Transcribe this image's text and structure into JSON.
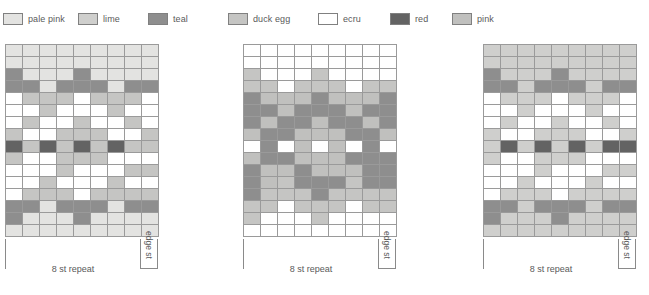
{
  "legend": {
    "items": [
      {
        "label": "pale pink",
        "color": "#e3e3e1"
      },
      {
        "label": "lime",
        "color": "#cfcfcd"
      },
      {
        "label": "teal",
        "color": "#8e8e8e"
      },
      {
        "label": "duck egg",
        "color": "#c5c5c3"
      },
      {
        "label": "ecru",
        "color": "#ffffff"
      },
      {
        "label": "red",
        "color": "#636363"
      },
      {
        "label": "pink",
        "color": "#c0c0be"
      }
    ]
  },
  "charts": [
    {
      "name": "chart-1",
      "columns": 9,
      "rows": 16,
      "repeat_label": "8 st repeat",
      "edge_label": "edge st",
      "edge_columns": 1,
      "grid": [
        [
          "pale pink",
          "pale pink",
          "pale pink",
          "pale pink",
          "pale pink",
          "pale pink",
          "pale pink",
          "pale pink",
          "pale pink"
        ],
        [
          "pale pink",
          "pale pink",
          "pale pink",
          "pale pink",
          "pale pink",
          "pale pink",
          "pale pink",
          "pale pink",
          "pale pink"
        ],
        [
          "teal",
          "pale pink",
          "pale pink",
          "pale pink",
          "teal",
          "pale pink",
          "pale pink",
          "pale pink",
          "pale pink"
        ],
        [
          "teal",
          "teal",
          "pale pink",
          "teal",
          "teal",
          "teal",
          "pale pink",
          "teal",
          "teal"
        ],
        [
          "ecru",
          "duck egg",
          "duck egg",
          "duck egg",
          "ecru",
          "duck egg",
          "duck egg",
          "duck egg",
          "ecru"
        ],
        [
          "ecru",
          "ecru",
          "duck egg",
          "ecru",
          "ecru",
          "ecru",
          "duck egg",
          "ecru",
          "ecru"
        ],
        [
          "ecru",
          "duck egg",
          "ecru",
          "ecru",
          "duck egg",
          "ecru",
          "ecru",
          "duck egg",
          "ecru"
        ],
        [
          "duck egg",
          "ecru",
          "ecru",
          "duck egg",
          "duck egg",
          "duck egg",
          "ecru",
          "ecru",
          "duck egg"
        ],
        [
          "red",
          "duck egg",
          "red",
          "duck egg",
          "red",
          "duck egg",
          "red",
          "duck egg",
          "duck egg"
        ],
        [
          "duck egg",
          "ecru",
          "ecru",
          "duck egg",
          "duck egg",
          "duck egg",
          "ecru",
          "ecru",
          "ecru"
        ],
        [
          "ecru",
          "ecru",
          "ecru",
          "duck egg",
          "ecru",
          "ecru",
          "ecru",
          "duck egg",
          "duck egg"
        ],
        [
          "ecru",
          "ecru",
          "duck egg",
          "ecru",
          "ecru",
          "ecru",
          "duck egg",
          "ecru",
          "ecru"
        ],
        [
          "ecru",
          "duck egg",
          "duck egg",
          "duck egg",
          "ecru",
          "duck egg",
          "duck egg",
          "duck egg",
          "duck egg"
        ],
        [
          "teal",
          "teal",
          "pale pink",
          "teal",
          "teal",
          "teal",
          "pale pink",
          "teal",
          "teal"
        ],
        [
          "teal",
          "pale pink",
          "pale pink",
          "pale pink",
          "teal",
          "pale pink",
          "pale pink",
          "pale pink",
          "pale pink"
        ],
        [
          "pale pink",
          "pale pink",
          "pale pink",
          "pale pink",
          "pale pink",
          "pale pink",
          "pale pink",
          "pale pink",
          "pale pink"
        ]
      ]
    },
    {
      "name": "chart-2",
      "columns": 9,
      "rows": 16,
      "repeat_label": "8 st repeat",
      "edge_label": "edge st",
      "edge_columns": 1,
      "grid": [
        [
          "ecru",
          "ecru",
          "ecru",
          "ecru",
          "ecru",
          "ecru",
          "ecru",
          "ecru",
          "ecru"
        ],
        [
          "ecru",
          "ecru",
          "ecru",
          "ecru",
          "ecru",
          "ecru",
          "ecru",
          "ecru",
          "ecru"
        ],
        [
          "duck egg",
          "ecru",
          "ecru",
          "ecru",
          "duck egg",
          "ecru",
          "ecru",
          "ecru",
          "ecru"
        ],
        [
          "duck egg",
          "duck egg",
          "ecru",
          "duck egg",
          "duck egg",
          "duck egg",
          "ecru",
          "duck egg",
          "duck egg"
        ],
        [
          "teal",
          "pink",
          "pink",
          "pink",
          "teal",
          "pink",
          "pink",
          "pink",
          "teal"
        ],
        [
          "teal",
          "teal",
          "pink",
          "teal",
          "teal",
          "teal",
          "pink",
          "teal",
          "teal"
        ],
        [
          "teal",
          "pink",
          "teal",
          "teal",
          "pink",
          "teal",
          "teal",
          "pink",
          "teal"
        ],
        [
          "pink",
          "teal",
          "teal",
          "pink",
          "pink",
          "pink",
          "teal",
          "teal",
          "pink"
        ],
        [
          "ecru",
          "teal",
          "ecru",
          "pink",
          "ecru",
          "pink",
          "ecru",
          "teal",
          "ecru"
        ],
        [
          "pink",
          "teal",
          "teal",
          "pink",
          "pink",
          "pink",
          "teal",
          "teal",
          "teal"
        ],
        [
          "teal",
          "pink",
          "pink",
          "teal",
          "pink",
          "pink",
          "pink",
          "teal",
          "teal"
        ],
        [
          "teal",
          "pink",
          "duck egg",
          "teal",
          "teal",
          "teal",
          "duck egg",
          "teal",
          "teal"
        ],
        [
          "teal",
          "duck egg",
          "duck egg",
          "duck egg",
          "teal",
          "duck egg",
          "duck egg",
          "duck egg",
          "duck egg"
        ],
        [
          "duck egg",
          "duck egg",
          "ecru",
          "duck egg",
          "duck egg",
          "duck egg",
          "ecru",
          "duck egg",
          "duck egg"
        ],
        [
          "duck egg",
          "ecru",
          "ecru",
          "ecru",
          "duck egg",
          "ecru",
          "ecru",
          "ecru",
          "ecru"
        ],
        [
          "ecru",
          "ecru",
          "ecru",
          "ecru",
          "ecru",
          "ecru",
          "ecru",
          "ecru",
          "ecru"
        ]
      ]
    },
    {
      "name": "chart-3",
      "columns": 9,
      "rows": 16,
      "repeat_label": "8 st repeat",
      "edge_label": "edge st",
      "edge_columns": 1,
      "grid": [
        [
          "lime",
          "lime",
          "lime",
          "lime",
          "lime",
          "lime",
          "lime",
          "lime",
          "lime"
        ],
        [
          "lime",
          "lime",
          "lime",
          "lime",
          "lime",
          "lime",
          "lime",
          "lime",
          "lime"
        ],
        [
          "teal",
          "lime",
          "lime",
          "lime",
          "teal",
          "lime",
          "lime",
          "lime",
          "lime"
        ],
        [
          "teal",
          "teal",
          "lime",
          "teal",
          "teal",
          "teal",
          "lime",
          "teal",
          "teal"
        ],
        [
          "ecru",
          "lime",
          "lime",
          "lime",
          "ecru",
          "lime",
          "lime",
          "lime",
          "ecru"
        ],
        [
          "ecru",
          "ecru",
          "lime",
          "ecru",
          "ecru",
          "ecru",
          "lime",
          "ecru",
          "ecru"
        ],
        [
          "ecru",
          "lime",
          "ecru",
          "ecru",
          "lime",
          "ecru",
          "ecru",
          "lime",
          "ecru"
        ],
        [
          "lime",
          "ecru",
          "ecru",
          "lime",
          "lime",
          "lime",
          "ecru",
          "ecru",
          "lime"
        ],
        [
          "lime",
          "red",
          "lime",
          "red",
          "lime",
          "red",
          "lime",
          "red",
          "red"
        ],
        [
          "lime",
          "ecru",
          "ecru",
          "lime",
          "lime",
          "lime",
          "ecru",
          "ecru",
          "ecru"
        ],
        [
          "ecru",
          "ecru",
          "ecru",
          "lime",
          "ecru",
          "ecru",
          "ecru",
          "lime",
          "lime"
        ],
        [
          "ecru",
          "ecru",
          "lime",
          "ecru",
          "ecru",
          "ecru",
          "lime",
          "ecru",
          "ecru"
        ],
        [
          "ecru",
          "lime",
          "lime",
          "lime",
          "ecru",
          "lime",
          "lime",
          "lime",
          "lime"
        ],
        [
          "teal",
          "teal",
          "lime",
          "teal",
          "teal",
          "teal",
          "lime",
          "teal",
          "teal"
        ],
        [
          "teal",
          "lime",
          "lime",
          "lime",
          "teal",
          "lime",
          "lime",
          "lime",
          "lime"
        ],
        [
          "lime",
          "lime",
          "lime",
          "lime",
          "lime",
          "lime",
          "lime",
          "lime",
          "lime"
        ]
      ]
    }
  ]
}
